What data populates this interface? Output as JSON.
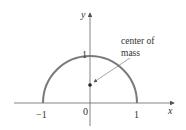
{
  "diagram": {
    "axes": {
      "x_label": "x",
      "y_label": "y"
    },
    "ticks": {
      "x_neg_one": "−1",
      "origin": "0",
      "x_one": "1",
      "y_one": "1"
    },
    "annotation": {
      "line1": "center of",
      "line2": "mass"
    },
    "curve": {
      "type": "upper semicircle",
      "radius": 1,
      "center": [
        0,
        0
      ]
    },
    "center_of_mass_point": {
      "x": 0,
      "y": 0.42
    },
    "colors": {
      "curve": "#7a7a7a",
      "axes": "#555555",
      "text": "#333333"
    }
  }
}
